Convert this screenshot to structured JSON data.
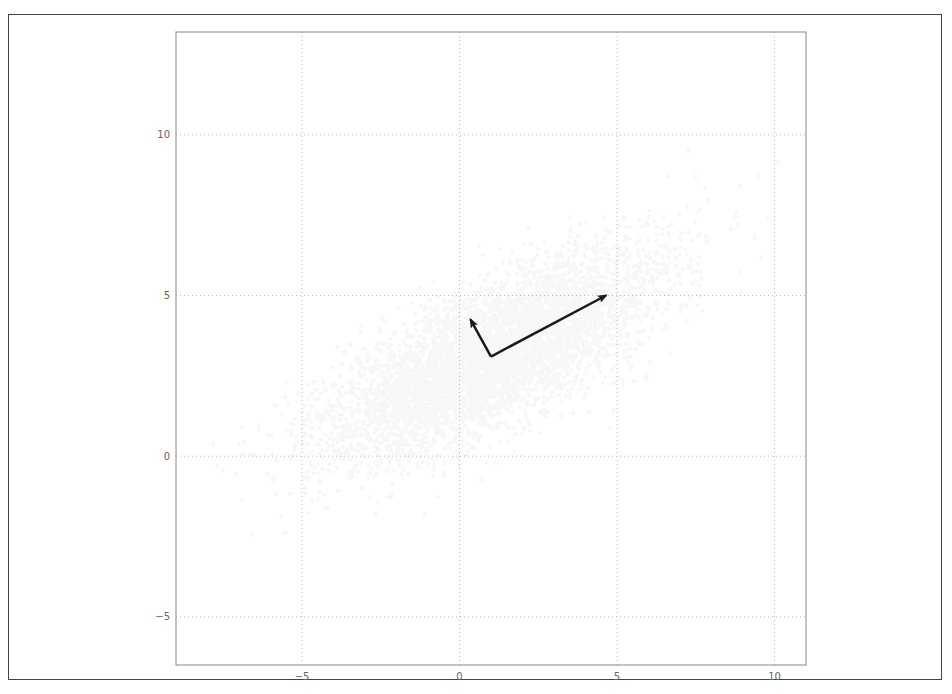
{
  "chart_data": {
    "type": "scatter",
    "title": "",
    "xlabel": "",
    "ylabel": "",
    "xlim": [
      -9,
      11
    ],
    "ylim": [
      -6.5,
      13.2
    ],
    "grid": true,
    "grid_style": "dotted",
    "legend": null,
    "xticks": [
      -5,
      0,
      5,
      10
    ],
    "yticks": [
      -5,
      0,
      5,
      10
    ],
    "xtick_labels": [
      "−5",
      "0",
      "5",
      "10"
    ],
    "ytick_labels": [
      "−5",
      "0",
      "5",
      "10"
    ],
    "point_data_note": "Individual points are NOT recoverable from the image. The cloud is rendered as a synthetic seeded sample matching the visible distribution shape; the parameters below describe that shape, not observed data.",
    "point_cloud_spec": {
      "kind": "synthetic_gaussian_approximation",
      "center": [
        1.0,
        3.1
      ],
      "major_axis_direction": [
        0.888,
        0.459
      ],
      "major_axis_std": 2.9,
      "minor_axis_std": 1.0,
      "point_count": 5000,
      "seed": 42,
      "marker_color": "#000000",
      "marker_alpha": 0.03,
      "marker_radius_px": 2.2
    },
    "annotations": [
      {
        "type": "arrow",
        "name": "principal-component-1",
        "from": [
          1.0,
          3.1
        ],
        "to": [
          4.65,
          5.0
        ],
        "color": "#1a1a1a"
      },
      {
        "type": "arrow",
        "name": "principal-component-2",
        "from": [
          1.0,
          3.1
        ],
        "to": [
          0.35,
          4.25
        ],
        "color": "#1a1a1a"
      }
    ]
  },
  "layout": {
    "plot_left": 176,
    "plot_top": 32,
    "plot_right": 806,
    "plot_bottom": 665
  }
}
